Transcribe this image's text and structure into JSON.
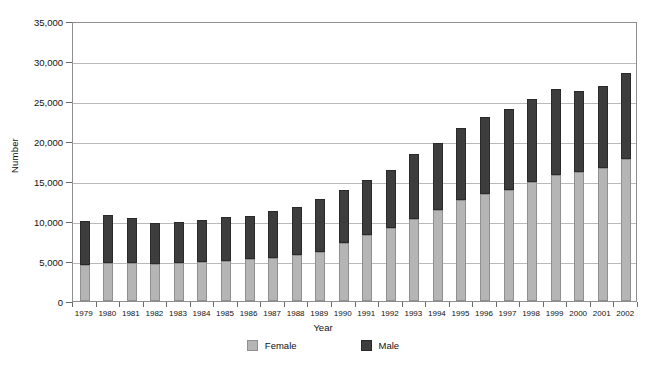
{
  "chart_data": {
    "type": "bar",
    "subtype": "stacked-vertical",
    "title": "",
    "xlabel": "Year",
    "ylabel": "Number",
    "ylim": [
      0,
      35000
    ],
    "yticks": [
      0,
      5000,
      10000,
      15000,
      20000,
      25000,
      30000,
      35000
    ],
    "ytick_labels": [
      "0",
      "5,000",
      "10,000",
      "15,000",
      "20,000",
      "25,000",
      "30,000",
      "35,000"
    ],
    "grid": "horizontal",
    "legend_position": "bottom",
    "categories": [
      "1979",
      "1980",
      "1981",
      "1982",
      "1983",
      "1984",
      "1985",
      "1986",
      "1987",
      "1988",
      "1989",
      "1990",
      "1991",
      "1992",
      "1993",
      "1994",
      "1995",
      "1996",
      "1997",
      "1998",
      "1999",
      "2000",
      "2001",
      "2002"
    ],
    "series": [
      {
        "name": "Female",
        "color": "#b5b5b5",
        "values": [
          4500,
          4800,
          4700,
          4600,
          4800,
          4900,
          5000,
          5200,
          5400,
          5800,
          6100,
          7200,
          8300,
          9100,
          10300,
          11400,
          12600,
          13400,
          13900,
          14900,
          15800,
          16100,
          16600,
          17700
        ]
      },
      {
        "name": "Male",
        "color": "#3d3d3d",
        "values": [
          5500,
          5900,
          5700,
          5100,
          5100,
          5200,
          5500,
          5400,
          5900,
          6000,
          6600,
          6700,
          6800,
          7300,
          8100,
          8400,
          9000,
          9600,
          10100,
          10400,
          10700,
          10200,
          10300,
          10800
        ]
      }
    ],
    "totals": [
      10000,
      10700,
      10400,
      9700,
      9900,
      10100,
      10500,
      10600,
      11300,
      11800,
      12700,
      13900,
      15100,
      16400,
      18400,
      19800,
      21600,
      23000,
      24000,
      25300,
      26500,
      26300,
      26900,
      28500
    ]
  },
  "legend": {
    "female_label": "Female",
    "male_label": "Male"
  },
  "colors": {
    "female": "#b5b5b5",
    "male": "#3d3d3d",
    "axis": "#8e8e8e",
    "grid": "#b9b9b9"
  }
}
